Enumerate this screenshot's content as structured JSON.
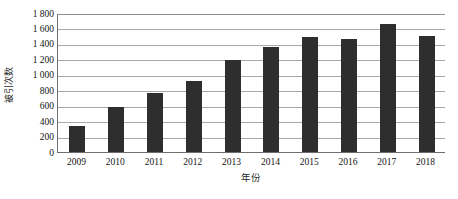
{
  "chart_data": {
    "type": "bar",
    "title": "",
    "xlabel": "年份",
    "ylabel": "被引次数",
    "categories": [
      "2009",
      "2010",
      "2011",
      "2012",
      "2013",
      "2014",
      "2015",
      "2016",
      "2017",
      "2018"
    ],
    "values": [
      340,
      580,
      760,
      920,
      1190,
      1360,
      1490,
      1460,
      1660,
      1500
    ],
    "series": [
      {
        "name": "被引次数",
        "values": [
          340,
          580,
          760,
          920,
          1190,
          1360,
          1490,
          1460,
          1660,
          1500
        ]
      }
    ],
    "ylim": [
      0,
      1800
    ],
    "ytick_labels": [
      "1 800",
      "1 600",
      "1 400",
      "1 200",
      "1 000",
      "800",
      "600",
      "400",
      "200",
      "0"
    ],
    "ytick_values": [
      1800,
      1600,
      1400,
      1200,
      1000,
      800,
      600,
      400,
      200,
      0
    ],
    "xtick_labels": [
      "2009",
      "2010",
      "2011",
      "2012",
      "2013",
      "2014",
      "2015",
      "2016",
      "2017",
      "2018"
    ],
    "grid": true,
    "legend": false,
    "legend_position": "none",
    "bar_color": "#2e2e2e",
    "gridline_color": "#a8a8a8",
    "axis_color": "#6e6e6e",
    "background_color": "#ffffff"
  }
}
